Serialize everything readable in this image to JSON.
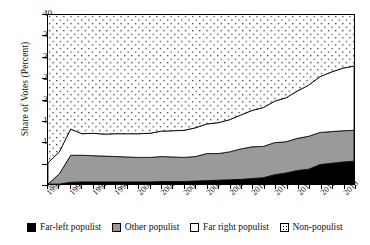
{
  "chart_data": {
    "type": "area",
    "title": "",
    "xlabel": "",
    "ylabel": "Share of Votes (Percent)",
    "ylim": [
      0,
      40
    ],
    "yticks": [
      0,
      5,
      10,
      15,
      20,
      25,
      30,
      35,
      40
    ],
    "xlim": [
      1992,
      2019
    ],
    "xticks": [
      1992,
      1994,
      1996,
      1998,
      2000,
      2002,
      2004,
      2006,
      2008,
      2010,
      2012,
      2014,
      2016,
      2018
    ],
    "grid": false,
    "stacked": true,
    "legend_position": "bottom",
    "x": [
      1992,
      1993,
      1994,
      1995,
      1996,
      1997,
      1998,
      1999,
      2000,
      2001,
      2002,
      2003,
      2004,
      2005,
      2006,
      2007,
      2008,
      2009,
      2010,
      2011,
      2012,
      2013,
      2014,
      2015,
      2016,
      2017,
      2018,
      2019
    ],
    "series": [
      {
        "name": "Far-left populist",
        "color": "#000000",
        "values": [
          0.0,
          0.0,
          0.4,
          0.5,
          0.5,
          0.5,
          0.5,
          0.5,
          0.5,
          0.5,
          0.6,
          0.6,
          0.6,
          0.7,
          0.8,
          0.9,
          1.0,
          1.1,
          1.3,
          1.5,
          2.2,
          2.6,
          3.2,
          3.5,
          4.6,
          4.9,
          5.2,
          5.4
        ]
      },
      {
        "name": "Other populist",
        "color": "#9a9a9a",
        "values": [
          0.0,
          2.4,
          6.4,
          6.3,
          6.2,
          6.1,
          6.0,
          5.9,
          5.8,
          5.8,
          5.9,
          5.8,
          5.7,
          5.8,
          6.4,
          6.3,
          6.6,
          7.2,
          7.5,
          7.4,
          7.6,
          7.4,
          7.6,
          7.8,
          7.6,
          7.5,
          7.4,
          7.3
        ]
      },
      {
        "name": "Far right populist",
        "color": "#ffffff",
        "values": [
          5.0,
          5.2,
          6.2,
          5.1,
          5.3,
          5.2,
          5.4,
          5.5,
          5.6,
          5.7,
          6.0,
          6.2,
          6.4,
          6.8,
          7.0,
          7.3,
          7.6,
          8.0,
          8.6,
          9.2,
          9.8,
          10.4,
          11.2,
          12.1,
          13.2,
          14.1,
          14.8,
          15.2
        ]
      },
      {
        "name": "Non-populist",
        "color": "#ffffff",
        "pattern": "dots",
        "values": [
          95.0,
          92.4,
          87.0,
          88.1,
          88.0,
          88.2,
          88.1,
          88.1,
          88.1,
          88.0,
          87.5,
          87.4,
          87.3,
          86.7,
          85.8,
          85.5,
          84.8,
          83.7,
          82.6,
          81.9,
          80.4,
          79.6,
          78.0,
          76.6,
          74.6,
          73.5,
          72.6,
          72.1
        ]
      }
    ],
    "cumulative_top_lines": {
      "far_left": [
        0.0,
        0.0,
        0.4,
        0.5,
        0.5,
        0.5,
        0.5,
        0.5,
        0.5,
        0.5,
        0.6,
        0.6,
        0.6,
        0.7,
        0.8,
        0.9,
        1.0,
        1.1,
        1.3,
        1.5,
        2.2,
        2.6,
        3.2,
        3.5,
        4.6,
        4.9,
        5.2,
        5.4
      ],
      "far_left_plus_other": [
        0.0,
        2.4,
        6.8,
        6.8,
        6.7,
        6.6,
        6.5,
        6.4,
        6.3,
        6.3,
        6.5,
        6.4,
        6.3,
        6.5,
        7.2,
        7.2,
        7.6,
        8.3,
        8.8,
        8.9,
        9.8,
        10.0,
        10.8,
        11.3,
        12.2,
        12.4,
        12.6,
        12.7
      ],
      "total_populist": [
        5.0,
        7.6,
        13.0,
        11.9,
        12.0,
        11.8,
        11.9,
        11.9,
        11.9,
        12.0,
        12.5,
        12.6,
        12.7,
        13.3,
        14.2,
        14.5,
        15.2,
        16.3,
        17.4,
        18.1,
        19.6,
        20.4,
        22.0,
        23.4,
        25.4,
        26.5,
        27.4,
        27.9
      ]
    },
    "legend": [
      {
        "label": "Far-left populist",
        "swatch": "black"
      },
      {
        "label": "Other populist",
        "swatch": "gray"
      },
      {
        "label": "Far right populist",
        "swatch": "white"
      },
      {
        "label": "Non-populist",
        "swatch": "dotted"
      }
    ]
  }
}
